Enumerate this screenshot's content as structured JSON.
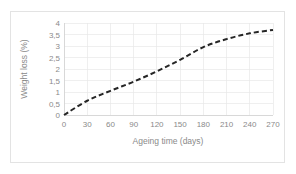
{
  "chart_data": {
    "type": "line",
    "title": "",
    "xlabel": "Ageing time (days)",
    "ylabel": "Weight loss (%)",
    "xlim": [
      0,
      270
    ],
    "ylim": [
      0,
      4
    ],
    "grid": true,
    "legend": "none",
    "decimal_separator": ",",
    "x_tick_labels": [
      "0",
      "30",
      "60",
      "90",
      "120",
      "150",
      "180",
      "210",
      "240",
      "270"
    ],
    "x_ticks": [
      0,
      30,
      60,
      90,
      120,
      150,
      180,
      210,
      240,
      270
    ],
    "y_tick_labels": [
      "0",
      "0,5",
      "1",
      "1,5",
      "2",
      "2,5",
      "3",
      "3,5",
      "4"
    ],
    "y_ticks": [
      0,
      0.5,
      1,
      1.5,
      2,
      2.5,
      3,
      3.5,
      4
    ],
    "series": [
      {
        "name": "Weight loss",
        "style": "dashed",
        "color": "#262626",
        "x": [
          0,
          30,
          60,
          90,
          120,
          150,
          180,
          210,
          240,
          270
        ],
        "values": [
          0,
          0.62,
          1.05,
          1.45,
          1.9,
          2.4,
          2.95,
          3.3,
          3.55,
          3.7
        ]
      }
    ]
  },
  "colors": {
    "line": "#262626",
    "grid": "#e8e8e8",
    "axis": "#d2d2d2",
    "text": "#8a8a8a",
    "frame": "#e3e3e3",
    "background": "#ffffff"
  }
}
